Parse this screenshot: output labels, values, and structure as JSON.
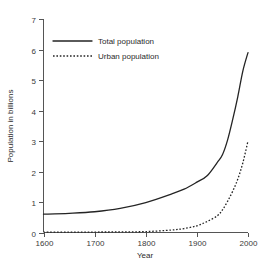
{
  "chart_data": {
    "type": "line",
    "title": "",
    "xlabel": "Year",
    "ylabel": "Population in billions",
    "xlim": [
      1600,
      2000
    ],
    "ylim": [
      0,
      7
    ],
    "grid": false,
    "legend_position": "top-left",
    "xticks": [
      1600,
      1700,
      1800,
      1900,
      2000
    ],
    "xtick_labels": [
      "1600",
      "1700",
      "1800",
      "1900",
      "2000"
    ],
    "yticks": [
      0,
      1,
      2,
      3,
      4,
      5,
      6,
      7
    ],
    "ytick_labels": [
      "0",
      "1",
      "2",
      "3",
      "4",
      "5",
      "6",
      "7"
    ],
    "series": [
      {
        "name": "Total population",
        "style": "solid",
        "color": "#242424",
        "x": [
          1600,
          1650,
          1700,
          1750,
          1800,
          1850,
          1875,
          1900,
          1920,
          1940,
          1950,
          1960,
          1970,
          1980,
          1990,
          2000
        ],
        "values": [
          0.6,
          0.63,
          0.68,
          0.79,
          0.98,
          1.26,
          1.42,
          1.65,
          1.86,
          2.3,
          2.55,
          3.03,
          3.7,
          4.45,
          5.3,
          5.9
        ]
      },
      {
        "name": "Urban population",
        "style": "dotted",
        "color": "#242424",
        "x": [
          1600,
          1650,
          1700,
          1750,
          1800,
          1850,
          1875,
          1900,
          1920,
          1940,
          1950,
          1960,
          1970,
          1980,
          1990,
          2000
        ],
        "values": [
          0.01,
          0.012,
          0.015,
          0.02,
          0.03,
          0.08,
          0.13,
          0.22,
          0.36,
          0.55,
          0.74,
          1.02,
          1.35,
          1.75,
          2.29,
          3.0
        ]
      }
    ]
  },
  "legend": {
    "items": [
      {
        "label": "Total population",
        "style": "solid"
      },
      {
        "label": "Urban population",
        "style": "dotted"
      }
    ]
  }
}
